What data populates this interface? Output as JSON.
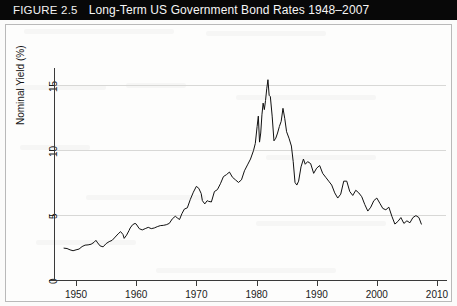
{
  "caption": {
    "figure_label": "FIGURE 2.5",
    "title": "Long-Term US Government Bond Rates 1948–2007"
  },
  "chart_data": {
    "type": "line",
    "title": "Long-Term US Government Bond Rates 1948–2007",
    "xlabel": "Year",
    "ylabel": "Nominal Yield (%)",
    "xlim": [
      1946.5,
      2011.5
    ],
    "ylim": [
      0,
      16.3
    ],
    "xticks": [
      1950,
      1960,
      1970,
      1980,
      1990,
      2000,
      2010
    ],
    "xticklabels": [
      "1950",
      "1960",
      "1970",
      "1980",
      "1990",
      "2000",
      "2010"
    ],
    "yticks": [
      0,
      5,
      10,
      15
    ],
    "yticklabels": [
      "0",
      "5",
      "10",
      "15"
    ],
    "grid": "horizontal",
    "legend": "none",
    "line_color": "#111111",
    "series": [
      {
        "name": "Nominal Yield (%)",
        "x": [
          1948.0,
          1948.5,
          1949.0,
          1949.5,
          1950.0,
          1950.5,
          1951.0,
          1951.5,
          1952.0,
          1952.5,
          1953.0,
          1953.3,
          1953.6,
          1954.0,
          1954.5,
          1955.0,
          1955.5,
          1956.0,
          1956.5,
          1957.0,
          1957.4,
          1957.8,
          1958.0,
          1958.4,
          1958.8,
          1959.0,
          1959.4,
          1959.8,
          1960.0,
          1960.5,
          1961.0,
          1961.5,
          1962.0,
          1962.5,
          1963.0,
          1963.5,
          1964.0,
          1964.5,
          1965.0,
          1965.5,
          1966.0,
          1966.5,
          1966.9,
          1967.2,
          1967.6,
          1968.0,
          1968.5,
          1969.0,
          1969.5,
          1970.0,
          1970.4,
          1970.8,
          1971.0,
          1971.4,
          1971.8,
          1972.0,
          1972.5,
          1973.0,
          1973.5,
          1974.0,
          1974.5,
          1975.0,
          1975.5,
          1976.0,
          1976.5,
          1977.0,
          1977.5,
          1978.0,
          1978.5,
          1979.0,
          1979.5,
          1979.8,
          1980.1,
          1980.3,
          1980.5,
          1980.7,
          1980.9,
          1981.1,
          1981.3,
          1981.5,
          1981.7,
          1981.9,
          1982.1,
          1982.3,
          1982.6,
          1982.9,
          1983.2,
          1983.5,
          1983.8,
          1984.1,
          1984.4,
          1984.7,
          1985.0,
          1985.4,
          1985.8,
          1986.1,
          1986.4,
          1986.7,
          1987.0,
          1987.4,
          1987.8,
          1988.1,
          1988.5,
          1989.0,
          1989.5,
          1990.0,
          1990.5,
          1991.0,
          1991.5,
          1992.0,
          1992.5,
          1993.0,
          1993.5,
          1994.0,
          1994.5,
          1995.0,
          1995.5,
          1996.0,
          1996.5,
          1997.0,
          1997.5,
          1998.0,
          1998.5,
          1999.0,
          1999.5,
          2000.0,
          2000.5,
          2001.0,
          2001.5,
          2002.0,
          2002.5,
          2003.0,
          2003.5,
          2004.0,
          2004.5,
          2005.0,
          2005.5,
          2006.0,
          2006.5,
          2007.0,
          2007.4
        ],
        "values": [
          2.45,
          2.42,
          2.32,
          2.25,
          2.32,
          2.38,
          2.57,
          2.68,
          2.7,
          2.75,
          2.9,
          3.05,
          2.85,
          2.62,
          2.55,
          2.8,
          2.95,
          3.05,
          3.3,
          3.55,
          3.72,
          3.5,
          3.2,
          3.45,
          3.8,
          4.0,
          4.25,
          4.35,
          4.3,
          3.95,
          3.85,
          3.95,
          4.05,
          3.95,
          4.0,
          4.1,
          4.18,
          4.2,
          4.25,
          4.35,
          4.7,
          4.9,
          4.75,
          4.65,
          5.1,
          5.45,
          5.55,
          6.2,
          6.75,
          7.2,
          7.05,
          6.65,
          6.1,
          5.85,
          6.1,
          6.05,
          6.0,
          6.8,
          6.95,
          7.4,
          7.95,
          8.1,
          8.3,
          7.9,
          7.7,
          7.5,
          7.7,
          8.4,
          8.85,
          9.3,
          9.95,
          10.5,
          11.8,
          12.6,
          10.6,
          11.3,
          12.7,
          13.6,
          13.1,
          13.8,
          14.7,
          15.4,
          14.2,
          14.1,
          12.6,
          10.7,
          10.9,
          11.3,
          11.8,
          12.2,
          13.2,
          12.4,
          11.4,
          10.9,
          10.3,
          9.1,
          7.5,
          7.3,
          7.6,
          8.7,
          9.3,
          8.9,
          9.1,
          8.95,
          8.2,
          8.6,
          8.8,
          8.2,
          7.9,
          7.6,
          7.3,
          6.7,
          6.3,
          6.6,
          7.6,
          7.6,
          6.8,
          6.5,
          6.9,
          6.7,
          6.4,
          5.8,
          5.3,
          5.6,
          6.1,
          6.3,
          5.9,
          5.5,
          5.4,
          5.6,
          4.9,
          4.3,
          4.5,
          4.8,
          4.35,
          4.55,
          4.4,
          4.8,
          4.95,
          4.8,
          4.3
        ]
      }
    ]
  }
}
